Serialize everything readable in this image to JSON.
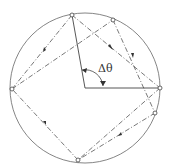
{
  "figure": {
    "angle_label": "Δθ",
    "colors": {
      "stroke": "#555555",
      "background": "#ffffff"
    }
  }
}
